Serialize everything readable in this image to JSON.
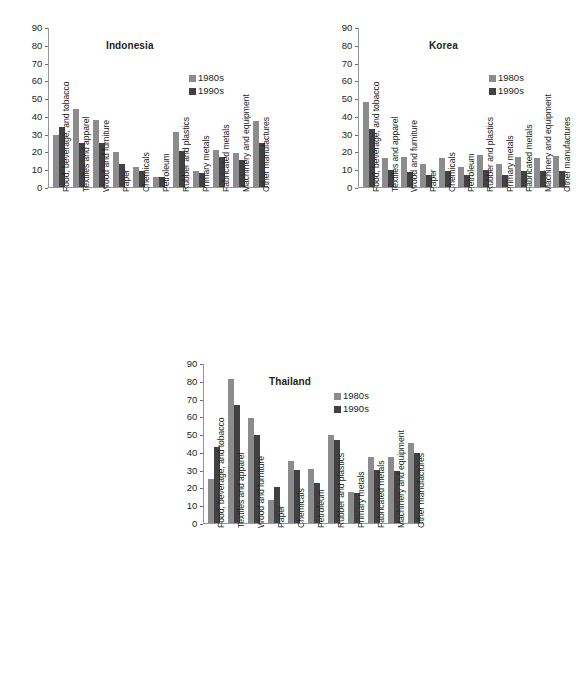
{
  "figure": {
    "series_labels": [
      "1980s",
      "1990s"
    ],
    "colors": {
      "series_1980s": "#8c8c8c",
      "series_1990s": "#414042",
      "axis": "#939598",
      "text": "#231f20"
    }
  },
  "chart_data": [
    {
      "type": "bar",
      "title": "Indonesia",
      "xlabel": "",
      "ylabel": "",
      "ylim": [
        0,
        90
      ],
      "yticks": [
        0,
        10,
        20,
        30,
        40,
        50,
        60,
        70,
        80,
        90
      ],
      "grid": false,
      "legend_position": "top-right",
      "categories": [
        "Food, beverage, and tobacco",
        "Textiles and apparel",
        "Wood and furniture",
        "Paper",
        "Chemicals",
        "Petroleum",
        "Rubber and plastics",
        "Primary metals",
        "Fabricated metals",
        "Machinery and equipment",
        "Other manufactures"
      ],
      "series": [
        {
          "name": "1980s",
          "values": [
            29,
            44,
            37.5,
            19.5,
            11,
            5.5,
            31,
            9,
            21,
            19,
            37
          ]
        },
        {
          "name": "1990s",
          "values": [
            34,
            24.5,
            24.5,
            13,
            9,
            5.5,
            20,
            8,
            17,
            15,
            25
          ]
        }
      ]
    },
    {
      "type": "bar",
      "title": "Korea",
      "xlabel": "",
      "ylabel": "",
      "ylim": [
        0,
        90
      ],
      "yticks": [
        0,
        10,
        20,
        30,
        40,
        50,
        60,
        70,
        80,
        90
      ],
      "grid": false,
      "legend_position": "top-right",
      "categories": [
        "Food, beverage, and tobacco",
        "Textiles and apparel",
        "Wood and furniture",
        "Paper",
        "Chemicals",
        "Petroleum",
        "Rubber and plastics",
        "Primary metals",
        "Fabricated metals",
        "Machinery and equipment",
        "Other manufactures"
      ],
      "series": [
        {
          "name": "1980s",
          "values": [
            48,
            16.5,
            17,
            13,
            16.5,
            11,
            18,
            13,
            17,
            16.5,
            17.5
          ]
        },
        {
          "name": "1990s",
          "values": [
            32.5,
            9.5,
            8.5,
            6.5,
            9,
            6.5,
            9.5,
            6.5,
            9,
            9,
            9
          ]
        }
      ]
    },
    {
      "type": "bar",
      "title": "Thailand",
      "xlabel": "",
      "ylabel": "",
      "ylim": [
        0,
        90
      ],
      "yticks": [
        0,
        10,
        20,
        30,
        40,
        50,
        60,
        70,
        80,
        90
      ],
      "grid": false,
      "legend_position": "top-right",
      "categories": [
        "Food, beverage, and tobacco",
        "Textiles and apparel",
        "Wood and furniture",
        "Paper",
        "Chemicals",
        "Petroleum",
        "Rubber and plastics",
        "Primary metals",
        "Fabricated metals",
        "Machinery and equipment",
        "Other manufactures"
      ],
      "series": [
        {
          "name": "1980s",
          "values": [
            25,
            81,
            59,
            13,
            35,
            30.5,
            49.5,
            17.5,
            37,
            37,
            45
          ]
        },
        {
          "name": "1990s",
          "values": [
            43,
            66.5,
            49.5,
            20,
            30,
            22.5,
            46.5,
            17,
            30,
            29,
            39.5
          ]
        }
      ]
    }
  ]
}
